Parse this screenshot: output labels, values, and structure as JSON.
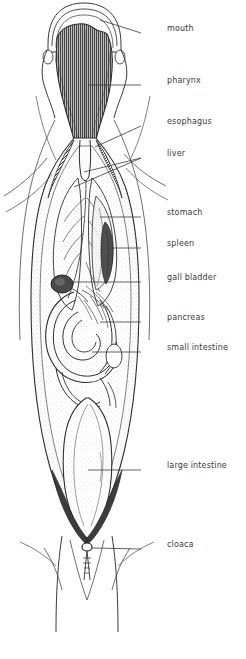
{
  "figure": {
    "ink_color": "#2e2e2e",
    "label_color": "#3b3b3b",
    "stipple_color": "#7a7a7a",
    "dark_fill": "#4a4a4a",
    "background": "#ffffff"
  },
  "labels": [
    {
      "id": "mouth",
      "text": "mouth",
      "x": 167,
      "y": 29,
      "leader": {
        "x1": 141,
        "y1": 33,
        "x2": 100,
        "y2": 20
      }
    },
    {
      "id": "pharynx",
      "text": "pharynx",
      "x": 167,
      "y": 81,
      "leader": {
        "x1": 141,
        "y1": 85,
        "x2": 88,
        "y2": 85
      }
    },
    {
      "id": "esophagus",
      "text": "esophagus",
      "x": 167,
      "y": 122,
      "leader": {
        "x1": 141,
        "y1": 126,
        "x2": 95,
        "y2": 147
      }
    },
    {
      "id": "liver",
      "text": "liver",
      "x": 167,
      "y": 154,
      "leader": {
        "x1": 141,
        "y1": 158,
        "x2": 74,
        "y2": 187
      }
    },
    {
      "id": "liver_second",
      "text": "",
      "x": 0,
      "y": 0,
      "leader": {
        "x1": 141,
        "y1": 158,
        "x2": 84,
        "y2": 172
      }
    },
    {
      "id": "stomach",
      "text": "stomach",
      "x": 167,
      "y": 213,
      "leader": {
        "x1": 141,
        "y1": 217,
        "x2": 100,
        "y2": 217
      }
    },
    {
      "id": "spleen",
      "text": "spleen",
      "x": 167,
      "y": 244,
      "leader": {
        "x1": 141,
        "y1": 248,
        "x2": 108,
        "y2": 248
      }
    },
    {
      "id": "gall_bladder",
      "text": "gall bladder",
      "x": 167,
      "y": 278,
      "leader": {
        "x1": 141,
        "y1": 282,
        "x2": 68,
        "y2": 282
      }
    },
    {
      "id": "pancreas",
      "text": "pancreas",
      "x": 167,
      "y": 318,
      "leader": {
        "x1": 141,
        "y1": 322,
        "x2": 100,
        "y2": 322
      }
    },
    {
      "id": "small_intestine",
      "text": "small intestine",
      "x": 167,
      "y": 348,
      "leader": {
        "x1": 141,
        "y1": 352,
        "x2": 92,
        "y2": 352
      }
    },
    {
      "id": "large_intestine",
      "text": "large intestine",
      "x": 167,
      "y": 466,
      "leader": {
        "x1": 141,
        "y1": 470,
        "x2": 88,
        "y2": 470
      }
    },
    {
      "id": "cloaca",
      "text": "cloaca",
      "x": 167,
      "y": 545,
      "leader": {
        "x1": 141,
        "y1": 549,
        "x2": 92,
        "y2": 548
      }
    }
  ],
  "organs": [
    {
      "id": "beak",
      "name": "mouth"
    },
    {
      "id": "pharynx_shape",
      "name": "pharynx"
    },
    {
      "id": "esophagus_shape",
      "name": "esophagus"
    },
    {
      "id": "liver_left",
      "name": "liver"
    },
    {
      "id": "liver_right",
      "name": "liver"
    },
    {
      "id": "stomach_shape",
      "name": "stomach"
    },
    {
      "id": "spleen_shape",
      "name": "spleen"
    },
    {
      "id": "gall_shape",
      "name": "gall bladder"
    },
    {
      "id": "pancreas_shape",
      "name": "pancreas"
    },
    {
      "id": "small_int_coil",
      "name": "small intestine"
    },
    {
      "id": "large_int_shape",
      "name": "large intestine"
    },
    {
      "id": "cloaca_shape",
      "name": "cloaca"
    }
  ]
}
